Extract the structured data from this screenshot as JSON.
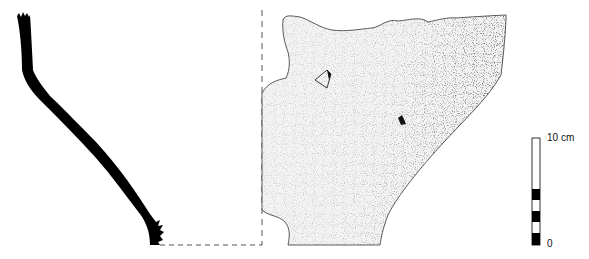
{
  "figure": {
    "views": [
      "section-profile",
      "exterior-view"
    ],
    "scale_bar": {
      "top_label": "10 cm",
      "bottom_label": "0",
      "segments": [
        "black",
        "white",
        "black",
        "white",
        "black",
        "white"
      ]
    },
    "colors": {
      "ink": "#000000",
      "paper": "#ffffff",
      "stipple": "#222222"
    }
  }
}
